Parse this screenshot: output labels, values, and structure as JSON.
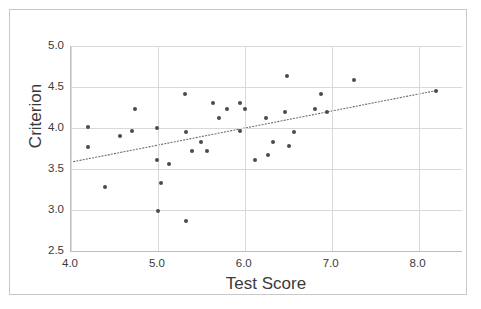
{
  "chart_data": {
    "type": "scatter",
    "title": "",
    "xlabel": "Test Score",
    "ylabel": "Criterion",
    "xlim": [
      4.0,
      8.5
    ],
    "ylim": [
      2.5,
      5.0
    ],
    "xticks": [
      "4.0",
      "5.0",
      "6.0",
      "7.0",
      "8.0"
    ],
    "xtick_values": [
      4.0,
      5.0,
      6.0,
      7.0,
      8.0
    ],
    "yticks": [
      "5.0",
      "4.5",
      "4.0",
      "3.5",
      "3.0",
      "2.5"
    ],
    "ytick_values": [
      5.0,
      4.5,
      4.0,
      3.5,
      3.0,
      2.5
    ],
    "grid": true,
    "legend": "none",
    "marker_color": "#4a4a52",
    "grid_color": "#d9d9d9",
    "points": [
      {
        "x": 4.2,
        "y": 4.01
      },
      {
        "x": 4.2,
        "y": 3.77
      },
      {
        "x": 4.39,
        "y": 3.28
      },
      {
        "x": 4.56,
        "y": 3.9
      },
      {
        "x": 4.7,
        "y": 3.96
      },
      {
        "x": 4.74,
        "y": 4.23
      },
      {
        "x": 4.99,
        "y": 4.0
      },
      {
        "x": 4.99,
        "y": 3.61
      },
      {
        "x": 5.0,
        "y": 2.99
      },
      {
        "x": 5.04,
        "y": 3.33
      },
      {
        "x": 5.13,
        "y": 3.56
      },
      {
        "x": 5.31,
        "y": 4.41
      },
      {
        "x": 5.32,
        "y": 3.95
      },
      {
        "x": 5.32,
        "y": 2.87
      },
      {
        "x": 5.39,
        "y": 3.72
      },
      {
        "x": 5.5,
        "y": 3.83
      },
      {
        "x": 5.57,
        "y": 3.72
      },
      {
        "x": 5.64,
        "y": 4.3
      },
      {
        "x": 5.7,
        "y": 4.12
      },
      {
        "x": 5.8,
        "y": 4.23
      },
      {
        "x": 5.94,
        "y": 4.3
      },
      {
        "x": 5.95,
        "y": 3.96
      },
      {
        "x": 6.0,
        "y": 4.23
      },
      {
        "x": 6.12,
        "y": 3.61
      },
      {
        "x": 6.24,
        "y": 4.12
      },
      {
        "x": 6.27,
        "y": 3.67
      },
      {
        "x": 6.33,
        "y": 3.83
      },
      {
        "x": 6.46,
        "y": 4.19
      },
      {
        "x": 6.49,
        "y": 4.63
      },
      {
        "x": 6.51,
        "y": 3.78
      },
      {
        "x": 6.57,
        "y": 3.95
      },
      {
        "x": 6.81,
        "y": 4.23
      },
      {
        "x": 6.88,
        "y": 4.41
      },
      {
        "x": 6.95,
        "y": 4.19
      },
      {
        "x": 7.26,
        "y": 4.58
      },
      {
        "x": 8.2,
        "y": 4.45
      }
    ],
    "trendline": {
      "style": "dotted",
      "color": "#6e6e6e",
      "x_start": 4.03,
      "y_start": 3.59,
      "x_end": 8.22,
      "y_end": 4.46
    }
  }
}
